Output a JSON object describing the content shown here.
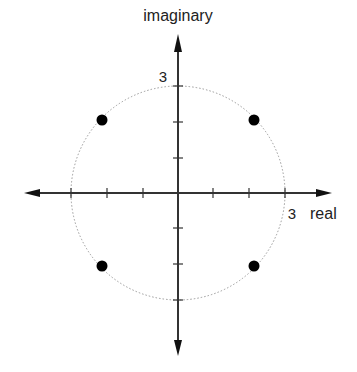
{
  "diagram": {
    "axes": {
      "x_label": "real",
      "y_label": "imaginary",
      "x_tick_label": "3",
      "y_tick_label": "3",
      "ticks_per_side": 3
    },
    "circle": {
      "radius": 3,
      "style": "dotted",
      "color": "#999999"
    },
    "points": [
      {
        "re": 2.12,
        "im": 2.12
      },
      {
        "re": -2.12,
        "im": 2.12
      },
      {
        "re": -2.12,
        "im": -2.12
      },
      {
        "re": 2.12,
        "im": -2.12
      }
    ],
    "colors": {
      "axis": "#333333",
      "point": "#000000"
    }
  }
}
